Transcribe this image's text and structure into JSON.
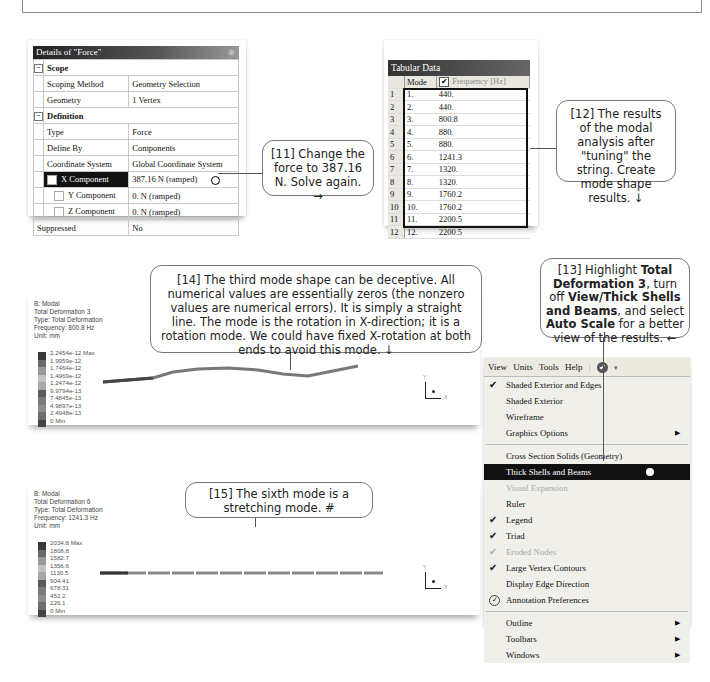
{
  "details_panel": {
    "title": "Details of \"Force\"",
    "pin_icon": "pin-icon",
    "groups": [
      {
        "name": "Scope",
        "rows": [
          {
            "label": "Scoping Method",
            "value": "Geometry Selection"
          },
          {
            "label": "Geometry",
            "value": "1 Vertex"
          }
        ]
      },
      {
        "name": "Definition",
        "rows": [
          {
            "label": "Type",
            "value": "Force"
          },
          {
            "label": "Define By",
            "value": "Components"
          },
          {
            "label": "Coordinate System",
            "value": "Global Coordinate System"
          },
          {
            "label": "X Component",
            "value": "387.16 N  (ramped)",
            "selected": true
          },
          {
            "label": "Y Component",
            "value": "0. N  (ramped)"
          },
          {
            "label": "Z Component",
            "value": "0. N  (ramped)"
          },
          {
            "label": "Suppressed",
            "value": "No"
          }
        ]
      }
    ]
  },
  "tabular": {
    "title": "Tabular Data",
    "headers": [
      "Mode",
      "Frequency [Hz]"
    ],
    "rows": [
      {
        "i": "1",
        "mode": "1.",
        "freq": "440."
      },
      {
        "i": "2",
        "mode": "2.",
        "freq": "440."
      },
      {
        "i": "3",
        "mode": "3.",
        "freq": "800.8"
      },
      {
        "i": "4",
        "mode": "4.",
        "freq": "880."
      },
      {
        "i": "5",
        "mode": "5.",
        "freq": "880."
      },
      {
        "i": "6",
        "mode": "6.",
        "freq": "1241.3"
      },
      {
        "i": "7",
        "mode": "7.",
        "freq": "1320."
      },
      {
        "i": "8",
        "mode": "8.",
        "freq": "1320."
      },
      {
        "i": "9",
        "mode": "9.",
        "freq": "1760.2"
      },
      {
        "i": "10",
        "mode": "10.",
        "freq": "1760.2"
      },
      {
        "i": "11",
        "mode": "11.",
        "freq": "2200.5"
      },
      {
        "i": "12",
        "mode": "12.",
        "freq": "2200.5"
      }
    ]
  },
  "callouts": {
    "c11": "[11] Change the force to 387.16 N. Solve again. →",
    "c12": "[12] The results of the modal analysis after \"tuning\" the string.  Create mode shape results. ↓",
    "c13_parts": [
      "[13] Highlight ",
      "Total Deformation 3",
      ", turn off ",
      "View/Thick Shells and Beams",
      ", and select ",
      "Auto Scale",
      " for a better view of the results. ←"
    ],
    "c14": "[14] The third mode shape can be deceptive.  All numerical values are essentially zeros (the nonzero values are numerical errors).  It is simply a straight line.  The mode is the rotation in X-direction; it is a rotation mode.  We could have fixed X-rotation at both ends to avoid this mode. ↓",
    "c15": "[15] The sixth mode is a stretching mode.  #"
  },
  "plot1": {
    "info": [
      "B: Modal",
      "Total Deformation 3",
      "Type: Total Deformation",
      "Frequency: 800.8 Hz",
      "Unit: mm"
    ],
    "legend": [
      "2.2454e-12 Max",
      "1.9959e-12",
      "1.7464e-12",
      "1.4969e-12",
      "1.2474e-12",
      "9.9794e-13",
      "7.4845e-13",
      "4.9897e-13",
      "2.4948e-13",
      "0 Min"
    ],
    "triad": {
      "y": "Y",
      "x": "X"
    }
  },
  "plot2": {
    "info": [
      "B: Modal",
      "Total Deformation 6",
      "Type: Total Deformation",
      "Frequency: 1241.3 Hz",
      "Unit: mm"
    ],
    "legend": [
      "2034.8 Max",
      "1808.8",
      "1582.7",
      "1356.6",
      "1130.5",
      "904.41",
      "678.31",
      "452.2",
      "226.1",
      "0 Min"
    ],
    "triad": {
      "y": "Y",
      "x": "X"
    }
  },
  "legend_colors": [
    "#3a3a3a",
    "#6a6a6a",
    "#9a9a9a",
    "#c2c2c2",
    "#a8a8a8",
    "#5a5a5a",
    "#7a7a7a",
    "#8c8c8c",
    "#6e6e6e",
    "#444444"
  ],
  "view_menu": {
    "menubar": [
      "View",
      "Units",
      "Tools",
      "Help"
    ],
    "items": [
      {
        "label": "Shaded Exterior and Edges",
        "checked": true
      },
      {
        "label": "Shaded Exterior"
      },
      {
        "label": "Wireframe"
      },
      {
        "label": "Graphics Options",
        "submenu": true
      },
      {
        "sep": true
      },
      {
        "label": "Cross Section Solids (Geometry)"
      },
      {
        "label": "Thick Shells and Beams",
        "highlighted": true
      },
      {
        "label": "Visual Expansion",
        "disabled": true
      },
      {
        "label": "Ruler"
      },
      {
        "label": "Legend",
        "checked": true
      },
      {
        "label": "Triad",
        "checked": true
      },
      {
        "label": "Eroded Nodes",
        "checked": true,
        "disabled": true
      },
      {
        "label": "Large Vertex Contours",
        "checked": true
      },
      {
        "label": "Display Edge Direction"
      },
      {
        "label": "Annotation Preferences",
        "icon": "annotation-icon"
      },
      {
        "sep": true
      },
      {
        "label": "Outline",
        "submenu": true
      },
      {
        "label": "Toolbars",
        "submenu": true
      },
      {
        "label": "Windows",
        "submenu": true
      }
    ]
  }
}
